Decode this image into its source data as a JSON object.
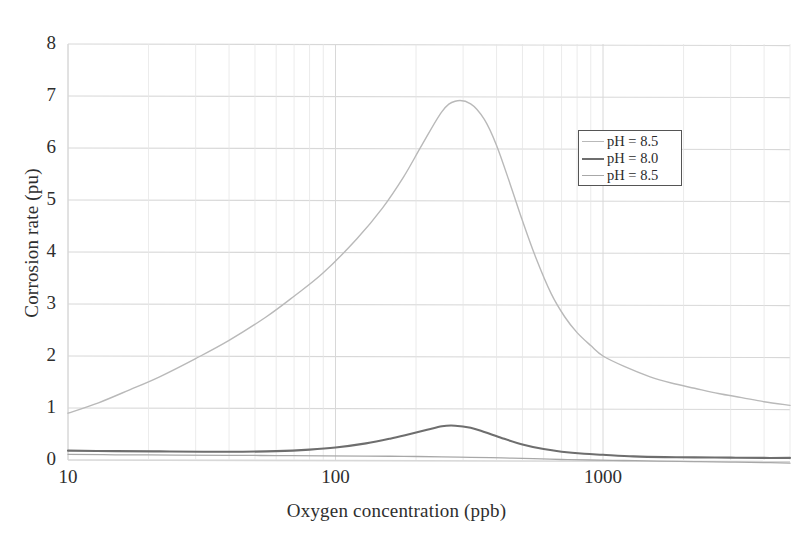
{
  "chart_data": {
    "type": "line",
    "title": "",
    "xlabel": "Oxygen concentration (ppb)",
    "ylabel": "Corrosion rate (pu)",
    "xscale": "log",
    "yscale": "linear",
    "xlim": [
      10,
      5000
    ],
    "ylim": [
      0,
      8
    ],
    "xticks": [
      10,
      100,
      1000
    ],
    "xtick_labels": [
      "10",
      "100",
      "1000"
    ],
    "yticks": [
      0,
      1,
      2,
      3,
      4,
      5,
      6,
      7,
      8
    ],
    "ytick_labels": [
      "0",
      "1",
      "2",
      "3",
      "4",
      "5",
      "6",
      "7",
      "8"
    ],
    "grid": true,
    "grid_minor_x": true,
    "legend_position": "upper right",
    "series": [
      {
        "name": "pH = 8.5",
        "color": "#b9b9b9",
        "width": 1.4,
        "x": [
          10,
          13,
          17,
          22,
          30,
          40,
          55,
          70,
          90,
          120,
          150,
          180,
          210,
          250,
          280,
          320,
          360,
          400,
          450,
          500,
          560,
          640,
          720,
          800,
          900,
          1000,
          1200,
          1500,
          1800,
          2200,
          2700,
          3300,
          4000,
          5000
        ],
        "values": [
          0.9,
          1.1,
          1.35,
          1.6,
          1.95,
          2.3,
          2.75,
          3.15,
          3.6,
          4.25,
          4.85,
          5.45,
          6.05,
          6.7,
          6.9,
          6.85,
          6.55,
          6.05,
          5.3,
          4.6,
          3.9,
          3.2,
          2.75,
          2.45,
          2.2,
          2.0,
          1.8,
          1.6,
          1.48,
          1.38,
          1.28,
          1.2,
          1.12,
          1.05
        ]
      },
      {
        "name": "pH = 8.0",
        "color": "#6e6e6e",
        "width": 2.1,
        "x": [
          10,
          15,
          22,
          32,
          45,
          60,
          80,
          100,
          130,
          160,
          190,
          220,
          250,
          280,
          320,
          360,
          420,
          500,
          600,
          700,
          850,
          1000,
          1300,
          1700,
          2200,
          3000,
          4000,
          5000
        ],
        "values": [
          0.18,
          0.17,
          0.165,
          0.16,
          0.16,
          0.17,
          0.2,
          0.24,
          0.32,
          0.41,
          0.5,
          0.58,
          0.65,
          0.66,
          0.62,
          0.54,
          0.42,
          0.3,
          0.21,
          0.16,
          0.12,
          0.1,
          0.07,
          0.055,
          0.05,
          0.045,
          0.04,
          0.04
        ]
      },
      {
        "name": "pH = 8.5",
        "color": "#a8a8a8",
        "width": 1.3,
        "x": [
          10,
          15,
          25,
          40,
          60,
          90,
          130,
          180,
          250,
          320,
          420,
          550,
          700,
          900,
          1200,
          1600,
          2200,
          3000,
          4000,
          5000
        ],
        "values": [
          0.11,
          0.1,
          0.095,
          0.09,
          0.085,
          0.08,
          0.075,
          0.07,
          0.06,
          0.05,
          0.04,
          0.025,
          0.01,
          0.0,
          -0.01,
          -0.02,
          -0.03,
          -0.04,
          -0.05,
          -0.06
        ]
      }
    ]
  },
  "legend": {
    "entries": [
      {
        "label": "pH = 8.5"
      },
      {
        "label": "pH = 8.0"
      },
      {
        "label": "pH = 8.5"
      }
    ]
  },
  "axes": {
    "y_title": "Corrosion rate (pu)",
    "x_title": "Oxygen concentration (ppb)",
    "y_tick_labels": [
      "8",
      "7",
      "6",
      "5",
      "4",
      "3",
      "2",
      "1",
      "0"
    ],
    "x_tick_labels": [
      "10",
      "100",
      "1000"
    ]
  },
  "colors": {
    "grid": "#d8d8d8",
    "grid_minor": "#e6e6e6",
    "text": "#2e2e2e",
    "background": "#ffffff"
  }
}
